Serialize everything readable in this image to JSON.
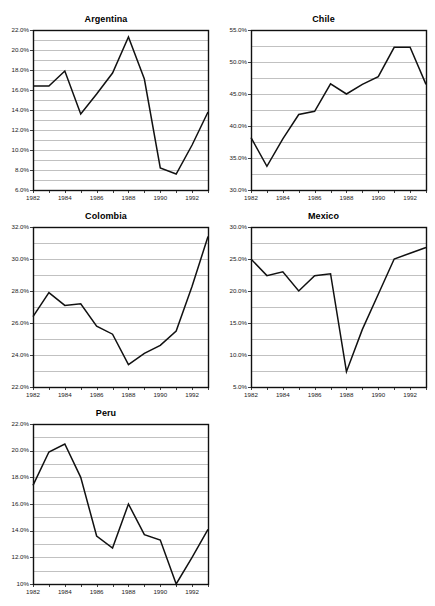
{
  "page": {
    "background_color": "#ffffff",
    "cut_off_header_text": "",
    "layout": "small-multiples-grid-2-columns"
  },
  "style": {
    "line_color": "#111111",
    "grid_color": "#a6a6a6",
    "frame_color": "#101010",
    "text_color": "#1a1a1a"
  },
  "chart_data": [
    {
      "type": "line",
      "title": "Argentina",
      "xlabel": "",
      "ylabel": "",
      "grid": true,
      "legend": "none",
      "x": [
        1982,
        1983,
        1984,
        1985,
        1986,
        1987,
        1988,
        1989,
        1990,
        1991,
        1992,
        1993
      ],
      "values": [
        16.4,
        16.4,
        17.9,
        13.6,
        15.6,
        17.7,
        21.3,
        17.1,
        8.2,
        7.6,
        10.5,
        13.8
      ],
      "ylim": [
        6.0,
        22.0
      ],
      "ytick_step": 2.0,
      "ygrid_step": 1.0,
      "ytick_labels": [
        "22.0%",
        "20.0%",
        "18.0%",
        "16.0%",
        "14.0%",
        "12.0%",
        "10.0%",
        "8.0%",
        "6.0%"
      ],
      "xtick_labels": [
        "1982",
        "1984",
        "1986",
        "1988",
        "1990",
        "1992"
      ],
      "xlim": [
        1982,
        1993
      ]
    },
    {
      "type": "line",
      "title": "Chile",
      "xlabel": "",
      "ylabel": "",
      "grid": true,
      "legend": "none",
      "x": [
        1982,
        1983,
        1984,
        1985,
        1986,
        1987,
        1988,
        1989,
        1990,
        1991,
        1992,
        1993
      ],
      "values": [
        38.2,
        33.7,
        38.0,
        41.8,
        42.3,
        46.6,
        45.0,
        46.5,
        47.7,
        52.3,
        52.3,
        46.5
      ],
      "ylim": [
        30.0,
        55.0
      ],
      "ytick_step": 5.0,
      "ygrid_step": 2.5,
      "ytick_labels": [
        "55.0%",
        "50.0%",
        "45.0%",
        "40.0%",
        "35.0%",
        "30.0%"
      ],
      "xtick_labels": [
        "1982",
        "1984",
        "1986",
        "1988",
        "1990",
        "1992"
      ],
      "xlim": [
        1982,
        1993
      ]
    },
    {
      "type": "line",
      "title": "Colombia",
      "xlabel": "",
      "ylabel": "",
      "grid": true,
      "legend": "none",
      "x": [
        1982,
        1983,
        1984,
        1985,
        1986,
        1987,
        1988,
        1989,
        1990,
        1991,
        1992,
        1993
      ],
      "values": [
        26.4,
        27.9,
        27.1,
        27.2,
        25.8,
        25.3,
        23.4,
        24.1,
        24.6,
        25.5,
        28.3,
        31.4
      ],
      "ylim": [
        22.0,
        32.0
      ],
      "ytick_step": 2.0,
      "ygrid_step": 1.0,
      "ytick_labels": [
        "32.0%",
        "30.0%",
        "28.0%",
        "26.0%",
        "24.0%",
        "22.0%"
      ],
      "xtick_labels": [
        "1982",
        "1984",
        "1986",
        "1988",
        "1990",
        "1992"
      ],
      "xlim": [
        1982,
        1993
      ]
    },
    {
      "type": "line",
      "title": "Mexico",
      "xlabel": "",
      "ylabel": "",
      "grid": true,
      "legend": "none",
      "x": [
        1982,
        1983,
        1984,
        1985,
        1986,
        1987,
        1988,
        1989,
        1990,
        1991,
        1992,
        1993
      ],
      "values": [
        25.0,
        22.4,
        23.0,
        20.0,
        22.4,
        22.7,
        7.4,
        14.0,
        19.5,
        25.0,
        25.9,
        26.8
      ],
      "ylim": [
        5.0,
        30.0
      ],
      "ytick_step": 5.0,
      "ygrid_step": 2.5,
      "ytick_labels": [
        "30.0%",
        "25.0%",
        "20.0%",
        "15.0%",
        "10.0%",
        "5.0%"
      ],
      "xtick_labels": [
        "1982",
        "1984",
        "1986",
        "1988",
        "1990",
        "1992"
      ],
      "xlim": [
        1982,
        1993
      ]
    },
    {
      "type": "line",
      "title": "Peru",
      "xlabel": "",
      "ylabel": "",
      "grid": true,
      "legend": "none",
      "x": [
        1982,
        1983,
        1984,
        1985,
        1986,
        1987,
        1988,
        1989,
        1990,
        1991,
        1992,
        1993
      ],
      "values": [
        17.4,
        19.9,
        20.5,
        18.0,
        13.6,
        12.7,
        16.0,
        13.7,
        13.3,
        10.0,
        12.0,
        14.1
      ],
      "ylim": [
        10.0,
        22.0
      ],
      "ytick_step": 2.0,
      "ygrid_step": 1.0,
      "ytick_labels": [
        "22.0%",
        "20.0%",
        "18.0%",
        "16.0%",
        "14.0%",
        "12.0%",
        "10%"
      ],
      "xtick_labels": [
        "1982",
        "1984",
        "1986",
        "1988",
        "1990",
        "1992"
      ],
      "xlim": [
        1982,
        1993
      ]
    }
  ],
  "panels": [
    {
      "name": "argentina",
      "left": 0,
      "top": 14,
      "width": 212,
      "height": 182,
      "plot_w": 175,
      "plot_h": 160,
      "pad_left": 33
    },
    {
      "name": "chile",
      "left": 216,
      "top": 14,
      "width": 215,
      "height": 182,
      "plot_w": 175,
      "plot_h": 160,
      "pad_left": 35
    },
    {
      "name": "colombia",
      "left": 0,
      "top": 211,
      "width": 212,
      "height": 182,
      "plot_w": 175,
      "plot_h": 160,
      "pad_left": 33
    },
    {
      "name": "mexico",
      "left": 216,
      "top": 211,
      "width": 215,
      "height": 182,
      "plot_w": 175,
      "plot_h": 160,
      "pad_left": 35
    },
    {
      "name": "peru",
      "left": 0,
      "top": 408,
      "width": 212,
      "height": 182,
      "plot_w": 175,
      "plot_h": 160,
      "pad_left": 33
    }
  ]
}
